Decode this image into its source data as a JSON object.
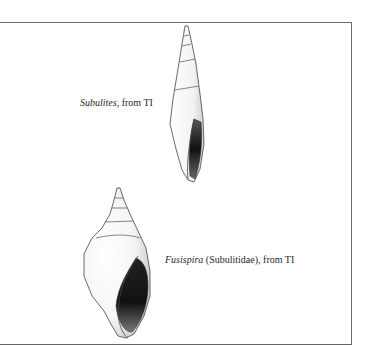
{
  "figure": {
    "specimens": [
      {
        "genus": "Subulites",
        "suffix": ", from TI",
        "shell_type": "slender-turreted"
      },
      {
        "genus": "Fusispira",
        "suffix": " (Subulitidae), from TI",
        "shell_type": "fusiform"
      }
    ]
  }
}
